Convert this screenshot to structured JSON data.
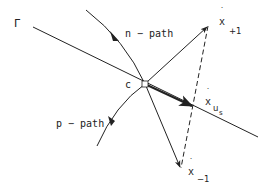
{
  "diagram": {
    "labels": {
      "gamma": "Γ",
      "n_path": "n − path",
      "p_path": "p − path",
      "c": "c",
      "x_plus1": {
        "base": "x",
        "dot": "˙",
        "sub": "+1"
      },
      "x_us": {
        "base": "x",
        "dot": "˙",
        "sub": "u",
        "subsub": "s"
      },
      "x_minus1": {
        "base": "x",
        "dot": "˙",
        "sub": "−1"
      }
    },
    "colors": {
      "stroke": "#222222",
      "background": "#ffffff"
    }
  }
}
